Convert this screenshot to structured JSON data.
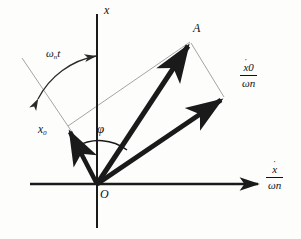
{
  "figure": {
    "kind": "phasor-vector-diagram",
    "background_color": "#fdfdfc",
    "stroke_color": "#1a1a1a",
    "thin_stroke_color": "#808080"
  },
  "axes": {
    "vertical": {
      "label": "x",
      "name": "displacement-axis"
    },
    "horizontal": {
      "numerator": "x",
      "numerator_accent": "˙",
      "denominator_symbol": "ω",
      "denominator_subscript": "n",
      "name": "velocity-axis"
    },
    "origin_label": "O"
  },
  "vectors": [
    {
      "id": "resultant",
      "label": "A",
      "name": "vector-A-resultant"
    },
    {
      "id": "initial-displacement",
      "label": "x",
      "subscript": "0",
      "name": "vector-x0"
    },
    {
      "id": "scaled-initial-velocity",
      "numerator": "x",
      "numerator_accent": "˙",
      "numerator_subscript": "0",
      "denominator_symbol": "ω",
      "denominator_subscript": "n",
      "name": "vector-x0dot-over-omegan"
    }
  ],
  "angles": [
    {
      "id": "phase-angle",
      "label": "φ",
      "name": "angle-phi-label"
    },
    {
      "id": "rotation-angle",
      "symbol": "ω",
      "subscript": "n",
      "variable": "t",
      "name": "angle-omega-n-t-label"
    }
  ]
}
